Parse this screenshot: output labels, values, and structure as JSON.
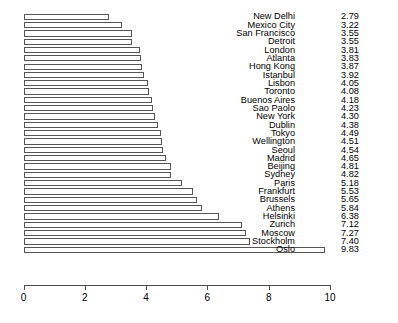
{
  "chart_data": {
    "type": "bar",
    "orientation": "horizontal",
    "title": "",
    "subtitle": "",
    "xlabel": "",
    "ylabel": "",
    "xlim": [
      0,
      10
    ],
    "grid": false,
    "legend": false,
    "bar_fill_color": "#ffffff",
    "bar_border_color": "#555555",
    "axis_color": "#4a4a4a",
    "xticks": [
      0,
      2,
      4,
      6,
      8,
      10
    ],
    "xtick_labels": [
      "0",
      "2",
      "4",
      "6",
      "8",
      "10"
    ],
    "categories": [
      "New Delhi",
      "Mexico City",
      "San Francisco",
      "Detroit",
      "London",
      "Atlanta",
      "Hong Kong",
      "Istanbul",
      "Lisbon",
      "Toronto",
      "Buenos Aires",
      "Sao Paolo",
      "New York",
      "Dublin",
      "Tokyo",
      "Wellington",
      "Seoul",
      "Madrid",
      "Beijing",
      "Sydney",
      "Paris",
      "Frankfurt",
      "Brussels",
      "Athens",
      "Helsinki",
      "Zurich",
      "Moscow",
      "Stockholm",
      "Oslo"
    ],
    "values": [
      2.79,
      3.22,
      3.55,
      3.55,
      3.81,
      3.83,
      3.87,
      3.92,
      4.05,
      4.08,
      4.18,
      4.23,
      4.3,
      4.38,
      4.49,
      4.51,
      4.54,
      4.65,
      4.81,
      4.82,
      5.18,
      5.53,
      5.65,
      5.84,
      6.38,
      7.12,
      7.27,
      7.4,
      9.83
    ],
    "value_labels": [
      "2.79",
      "3.22",
      "3.55",
      "3.55",
      "3.81",
      "3.83",
      "3.87",
      "3.92",
      "4.05",
      "4.08",
      "4.18",
      "4.23",
      "4.30",
      "4.38",
      "4.49",
      "4.51",
      "4.54",
      "4.65",
      "4.81",
      "4.82",
      "5.18",
      "5.53",
      "5.65",
      "5.84",
      "6.38",
      "7.12",
      "7.27",
      "7.40",
      "9.83"
    ]
  }
}
